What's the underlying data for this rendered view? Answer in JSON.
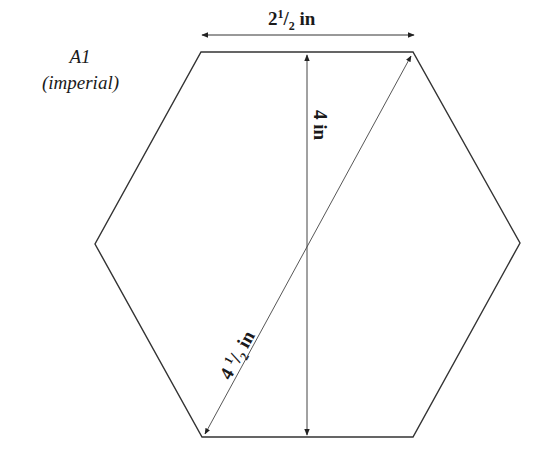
{
  "figure": {
    "title": "A1",
    "subtitle": "(imperial)",
    "shape": "regular-hexagon",
    "stroke_color": "#333333",
    "dimensions": {
      "side": {
        "whole": "2",
        "num": "1",
        "den": "2",
        "unit": "in"
      },
      "height": {
        "text": "4 in"
      },
      "diagonal": {
        "whole": "4 ",
        "num": "1",
        "den": "2",
        "unit": "in"
      }
    }
  }
}
